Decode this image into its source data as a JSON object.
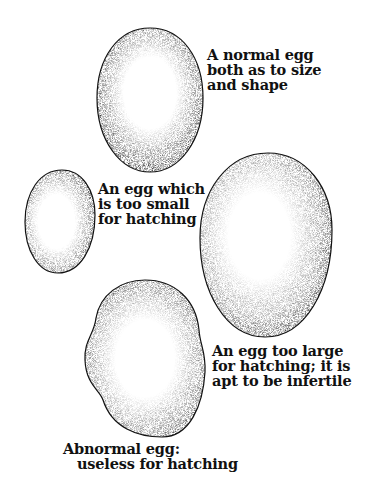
{
  "figure": {
    "colors": {
      "ink": "#111111",
      "background": "#ffffff"
    },
    "eggs": [
      {
        "id": "normal",
        "label_lines": [
          "A normal egg",
          "both as to size",
          "and shape"
        ]
      },
      {
        "id": "too-small",
        "label_lines": [
          "An egg which",
          "is too small",
          "for hatching"
        ]
      },
      {
        "id": "too-large",
        "label_lines": [
          "An egg too large",
          "for hatching; it is",
          "apt to be infertile"
        ]
      },
      {
        "id": "abnormal",
        "label_lines": [
          "Abnormal egg:",
          "useless for hatching"
        ]
      }
    ]
  }
}
